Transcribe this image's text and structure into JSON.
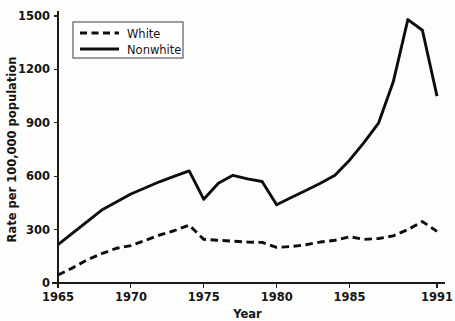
{
  "chart_data": {
    "type": "line",
    "title": "",
    "xlabel": "Year",
    "ylabel": "Rate per 100,000 population",
    "xlim": [
      1965,
      1991
    ],
    "ylim": [
      0,
      1500
    ],
    "grid": false,
    "legend_position": "top-left",
    "xticks": [
      "1965",
      "1970",
      "1975",
      "1980",
      "1985",
      "1991"
    ],
    "xtick_values": [
      1965,
      1970,
      1975,
      1980,
      1985,
      1991
    ],
    "yticks": [
      "0",
      "300",
      "600",
      "900",
      "1200",
      "1500"
    ],
    "ytick_values": [
      0,
      300,
      600,
      900,
      1200,
      1500
    ],
    "x": [
      1965,
      1966,
      1967,
      1968,
      1969,
      1970,
      1971,
      1972,
      1973,
      1974,
      1975,
      1976,
      1977,
      1978,
      1979,
      1980,
      1981,
      1982,
      1983,
      1984,
      1985,
      1986,
      1987,
      1988,
      1989,
      1990,
      1991
    ],
    "series": [
      {
        "name": "White",
        "style": "dashed",
        "color": "#0d0d0d",
        "values": [
          45,
          85,
          130,
          165,
          195,
          210,
          240,
          270,
          295,
          325,
          245,
          240,
          235,
          230,
          228,
          200,
          205,
          215,
          230,
          240,
          260,
          245,
          250,
          265,
          300,
          345,
          290
        ]
      },
      {
        "name": "Nonwhite",
        "style": "solid",
        "color": "#0d0d0d",
        "values": [
          215,
          280,
          345,
          410,
          455,
          500,
          535,
          570,
          600,
          630,
          470,
          560,
          605,
          585,
          570,
          440,
          480,
          520,
          560,
          605,
          690,
          790,
          900,
          1130,
          1480,
          1420,
          1050
        ]
      }
    ]
  },
  "legend": {
    "entries": [
      {
        "label": "White",
        "style": "dashed"
      },
      {
        "label": "Nonwhite",
        "style": "solid"
      }
    ]
  }
}
